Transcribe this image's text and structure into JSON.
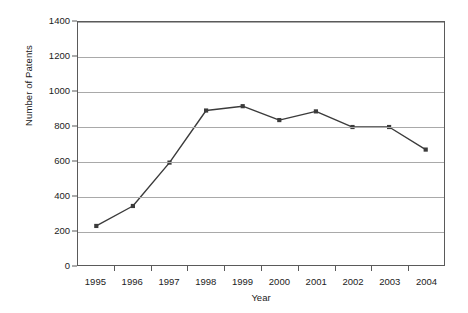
{
  "chart_data": {
    "type": "line",
    "title": "",
    "xlabel": "Year",
    "ylabel": "Number of Patents",
    "categories": [
      "1995",
      "1996",
      "1997",
      "1998",
      "1999",
      "2000",
      "2001",
      "2002",
      "2003",
      "2004"
    ],
    "values": [
      225,
      340,
      590,
      890,
      915,
      835,
      885,
      795,
      795,
      665
    ],
    "series": [
      {
        "name": "Number of Patents",
        "values": [
          225,
          340,
          590,
          890,
          915,
          835,
          885,
          795,
          795,
          665
        ]
      }
    ],
    "ylim": [
      0,
      1400
    ],
    "y_ticks": [
      0,
      200,
      400,
      600,
      800,
      1000,
      1200,
      1400
    ],
    "y_ticklabels": [
      "0",
      "200",
      "400",
      "600",
      "800",
      "1000",
      "1200",
      "1400"
    ],
    "grid": "horizontal",
    "legend": "none",
    "marker": "square",
    "line_color": "#3b3b3b",
    "marker_color": "#3b3b3b",
    "gridline_color": "#a9a9a9",
    "axis_color": "#5a5a5a",
    "background_color": "#ffffff"
  }
}
